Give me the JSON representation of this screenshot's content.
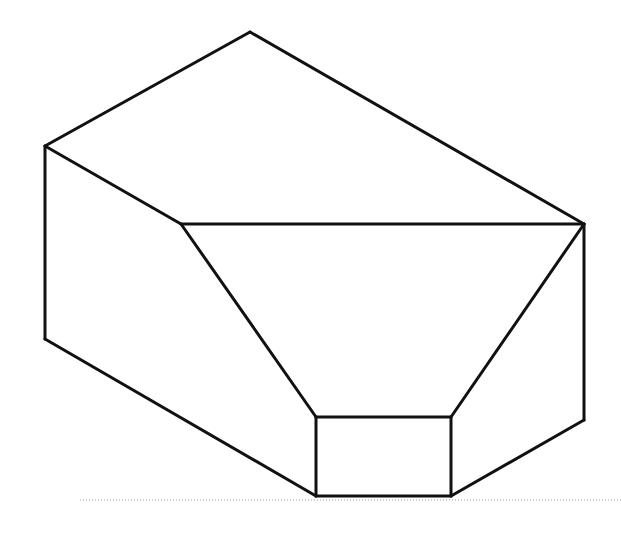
{
  "diagram": {
    "type": "isometric-line-drawing",
    "stroke_color": "#111111",
    "background": "#ffffff",
    "stroke_width": 3,
    "vertices": {
      "apex": [
        250,
        32
      ],
      "left_top": [
        45,
        146
      ],
      "inner_left": [
        181,
        224
      ],
      "right_top": [
        584,
        224
      ],
      "left_bottom": [
        45,
        339
      ],
      "box_tl": [
        316,
        417
      ],
      "box_tr": [
        451,
        417
      ],
      "box_bl": [
        316,
        496
      ],
      "box_br": [
        451,
        496
      ],
      "right_bottom": [
        584,
        420
      ]
    },
    "edges": [
      [
        "apex",
        "left_top"
      ],
      [
        "apex",
        "right_top"
      ],
      [
        "left_top",
        "inner_left"
      ],
      [
        "inner_left",
        "right_top"
      ],
      [
        "left_top",
        "left_bottom"
      ],
      [
        "left_bottom",
        "box_bl"
      ],
      [
        "inner_left",
        "box_tl"
      ],
      [
        "right_top",
        "box_tr"
      ],
      [
        "box_tl",
        "box_tr"
      ],
      [
        "box_tr",
        "box_br"
      ],
      [
        "box_br",
        "box_bl"
      ],
      [
        "box_bl",
        "box_tl"
      ],
      [
        "right_top",
        "right_bottom"
      ],
      [
        "right_bottom",
        "box_br"
      ]
    ],
    "baseline": {
      "x1": 80,
      "x2": 621,
      "y": 500,
      "style": "dotted",
      "color": "#999999"
    }
  }
}
